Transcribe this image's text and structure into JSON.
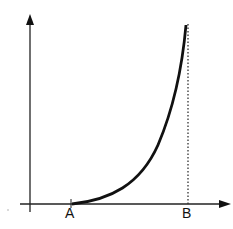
{
  "diagram": {
    "type": "growth-curve",
    "x_axis": {
      "has_arrow": true
    },
    "y_axis": {
      "has_arrow": true
    },
    "labels": {
      "a": "A",
      "b": "B"
    },
    "curve": {
      "description": "increasing convex curve from A rising steeply toward B",
      "color": "#111111"
    },
    "guide": {
      "style": "dotted vertical line at B"
    }
  }
}
